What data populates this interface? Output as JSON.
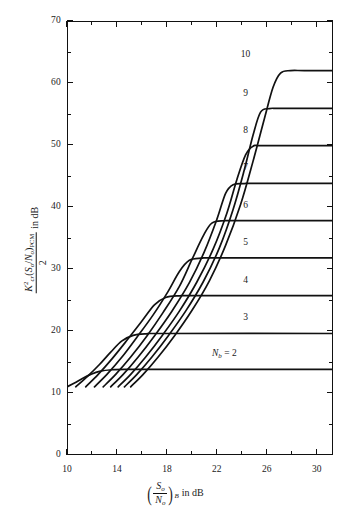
{
  "chart_data": {
    "type": "line",
    "title": "",
    "xlabel": "(S_o/N_o)_B in dB",
    "ylabel": "K_cr^2 (S_o/N_o)_PCM / 2  in dB",
    "xlim": [
      10,
      31.3
    ],
    "ylim": [
      0,
      70
    ],
    "grid": false,
    "legend_position": "inline-right-of-curve",
    "x_ticks_major": [
      10,
      14,
      18,
      22,
      26,
      30
    ],
    "x_ticks_minor": [
      12,
      16,
      20,
      24,
      28
    ],
    "y_ticks_major": [
      0,
      10,
      20,
      30,
      40,
      50,
      60,
      70
    ],
    "y_ticks_minor": [
      5,
      15,
      25,
      35,
      45,
      55,
      65
    ],
    "series": [
      {
        "name": "2",
        "label": "N_b = 2",
        "label_html": "<span class=\"mvar\">N</span><span class=\"msub\">b</span> = 2",
        "plateau": 13.8,
        "knee_x": 16.8,
        "label_x": 22.6,
        "label_y": 16.4,
        "points": [
          [
            10.0,
            11.0
          ],
          [
            10.6,
            11.6
          ],
          [
            11.2,
            12.3
          ],
          [
            11.9,
            13.0
          ],
          [
            12.6,
            13.5
          ],
          [
            13.6,
            13.75
          ],
          [
            15.0,
            13.8
          ],
          [
            17.0,
            13.8
          ],
          [
            31.3,
            13.8
          ]
        ]
      },
      {
        "name": "3",
        "label": "3",
        "label_html": "3",
        "plateau": 19.6,
        "knee_x": 17.9,
        "label_x": 24.3,
        "label_y": 22.2,
        "points": [
          [
            10.7,
            11.0
          ],
          [
            11.6,
            12.6
          ],
          [
            12.6,
            14.6
          ],
          [
            13.5,
            16.6
          ],
          [
            14.4,
            18.4
          ],
          [
            15.3,
            19.3
          ],
          [
            16.4,
            19.55
          ],
          [
            18.0,
            19.6
          ],
          [
            31.3,
            19.6
          ]
        ]
      },
      {
        "name": "4",
        "label": "4",
        "label_html": "4",
        "plateau": 25.7,
        "knee_x": 18.8,
        "label_x": 24.3,
        "label_y": 28.3,
        "points": [
          [
            11.5,
            11.0
          ],
          [
            12.5,
            13.0
          ],
          [
            13.6,
            15.5
          ],
          [
            14.8,
            18.5
          ],
          [
            16.0,
            21.6
          ],
          [
            17.0,
            24.2
          ],
          [
            17.9,
            25.4
          ],
          [
            19.0,
            25.68
          ],
          [
            20.5,
            25.7
          ],
          [
            31.3,
            25.7
          ]
        ]
      },
      {
        "name": "5",
        "label": "5",
        "label_html": "5",
        "plateau": 31.8,
        "knee_x": 19.6,
        "label_x": 24.3,
        "label_y": 34.4,
        "points": [
          [
            12.2,
            11.0
          ],
          [
            13.2,
            13.0
          ],
          [
            14.4,
            15.8
          ],
          [
            15.6,
            19.0
          ],
          [
            16.9,
            22.6
          ],
          [
            18.1,
            26.4
          ],
          [
            19.0,
            29.6
          ],
          [
            19.8,
            31.4
          ],
          [
            20.8,
            31.75
          ],
          [
            22.0,
            31.8
          ],
          [
            31.3,
            31.8
          ]
        ]
      },
      {
        "name": "6",
        "label": "6",
        "label_html": "6",
        "plateau": 37.8,
        "knee_x": 20.4,
        "label_x": 24.3,
        "label_y": 40.4,
        "points": [
          [
            12.9,
            11.0
          ],
          [
            13.9,
            13.0
          ],
          [
            15.1,
            15.8
          ],
          [
            16.4,
            19.2
          ],
          [
            17.7,
            23.0
          ],
          [
            19.0,
            27.2
          ],
          [
            20.0,
            31.5
          ],
          [
            20.9,
            35.3
          ],
          [
            21.6,
            37.4
          ],
          [
            22.6,
            37.78
          ],
          [
            23.8,
            37.8
          ],
          [
            31.3,
            37.8
          ]
        ]
      },
      {
        "name": "7",
        "label": "7",
        "label_html": "7",
        "plateau": 43.8,
        "knee_x": 21.2,
        "label_x": 24.3,
        "label_y": 46.4,
        "points": [
          [
            13.5,
            11.0
          ],
          [
            14.5,
            13.0
          ],
          [
            15.7,
            15.8
          ],
          [
            17.0,
            19.2
          ],
          [
            18.4,
            23.2
          ],
          [
            19.8,
            27.8
          ],
          [
            21.0,
            32.8
          ],
          [
            22.0,
            38.0
          ],
          [
            22.7,
            42.2
          ],
          [
            23.3,
            43.6
          ],
          [
            24.2,
            43.78
          ],
          [
            25.3,
            43.8
          ],
          [
            31.3,
            43.8
          ]
        ]
      },
      {
        "name": "8",
        "label": "8",
        "label_html": "8",
        "plateau": 49.9,
        "knee_x": 22.0,
        "label_x": 24.3,
        "label_y": 52.4,
        "points": [
          [
            14.1,
            11.0
          ],
          [
            15.1,
            13.0
          ],
          [
            16.3,
            15.8
          ],
          [
            17.6,
            19.2
          ],
          [
            19.0,
            23.2
          ],
          [
            20.4,
            27.9
          ],
          [
            21.7,
            33.2
          ],
          [
            22.8,
            39.0
          ],
          [
            23.6,
            44.4
          ],
          [
            24.3,
            48.4
          ],
          [
            24.9,
            49.8
          ],
          [
            25.8,
            49.9
          ],
          [
            31.3,
            49.9
          ]
        ]
      },
      {
        "name": "9",
        "label": "9",
        "label_html": "9",
        "plateau": 55.9,
        "knee_x": 22.7,
        "label_x": 24.3,
        "label_y": 58.4,
        "points": [
          [
            14.6,
            11.0
          ],
          [
            15.6,
            13.0
          ],
          [
            16.8,
            15.8
          ],
          [
            18.1,
            19.2
          ],
          [
            19.5,
            23.2
          ],
          [
            20.9,
            27.9
          ],
          [
            22.2,
            33.4
          ],
          [
            23.3,
            39.6
          ],
          [
            24.2,
            46.0
          ],
          [
            24.9,
            51.6
          ],
          [
            25.5,
            55.3
          ],
          [
            26.2,
            55.88
          ],
          [
            27.2,
            55.9
          ],
          [
            31.3,
            55.9
          ]
        ]
      },
      {
        "name": "10",
        "label": "10",
        "label_html": "10",
        "plateau": 62.0,
        "knee_x": 23.5,
        "label_x": 24.3,
        "label_y": 64.6,
        "points": [
          [
            15.1,
            11.0
          ],
          [
            16.1,
            13.0
          ],
          [
            17.3,
            15.8
          ],
          [
            18.6,
            19.2
          ],
          [
            20.0,
            23.3
          ],
          [
            21.4,
            28.1
          ],
          [
            22.7,
            33.8
          ],
          [
            23.9,
            40.4
          ],
          [
            24.9,
            47.4
          ],
          [
            25.8,
            54.2
          ],
          [
            26.5,
            59.3
          ],
          [
            27.1,
            61.6
          ],
          [
            27.9,
            62.0
          ],
          [
            29.0,
            62.0
          ],
          [
            31.3,
            62.0
          ]
        ]
      }
    ]
  },
  "axes": {
    "y_title_parts": {
      "numerator_k": "K",
      "numerator_k_sup": "2",
      "numerator_k_sub": "cr",
      "numerator_so": "S",
      "numerator_so_sub": "o",
      "numerator_no": "N",
      "numerator_no_sub": "o",
      "numerator_pcm_sub": "PCM",
      "denominator": "2",
      "units": "in dB",
      "slash": "/",
      "open_paren": "(",
      "close_paren": ")"
    },
    "x_title_parts": {
      "so": "S",
      "so_sub": "o",
      "no": "N",
      "no_sub": "o",
      "b_sub": "B",
      "units": "in dB"
    }
  },
  "caption": ""
}
